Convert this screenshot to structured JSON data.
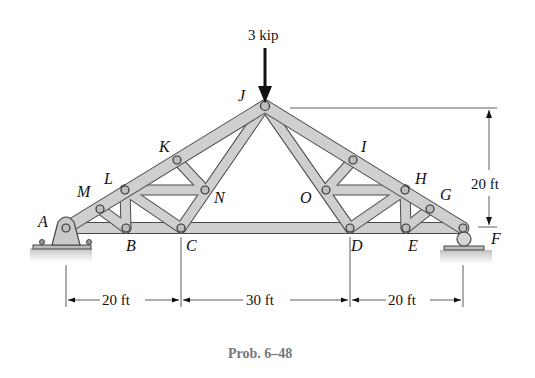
{
  "load": {
    "label": "3 kip"
  },
  "joints": {
    "A": "A",
    "B": "B",
    "C": "C",
    "D": "D",
    "E": "E",
    "F": "F",
    "G": "G",
    "H": "H",
    "I": "I",
    "J": "J",
    "K": "K",
    "L": "L",
    "M": "M",
    "N": "N",
    "O": "O"
  },
  "dimensions": {
    "height": "20 ft",
    "span_left": "20 ft",
    "span_middle": "30 ft",
    "span_right": "20 ft"
  },
  "caption": "Prob. 6–48",
  "colors": {
    "member_fill": "#c9c9c9",
    "member_stroke": "#4a4a4a",
    "caption": "#777777"
  }
}
